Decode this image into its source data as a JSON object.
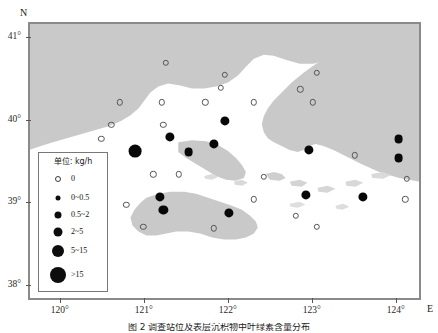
{
  "figure": {
    "caption": "图 2  调查站位及表层沉积物中叶绿素含量分布"
  },
  "axes": {
    "north_letter": "N",
    "east_letter": "E",
    "y_ticks": [
      "41°",
      "40°",
      "39°",
      "38°"
    ],
    "x_ticks": [
      "120°",
      "121°",
      "122°",
      "123°",
      "124°"
    ]
  },
  "legend": {
    "title": "单位: kg/h",
    "items": [
      {
        "label": "0",
        "style": "open",
        "size": 4
      },
      {
        "label": "0~0.5",
        "style": "filled",
        "size": 5
      },
      {
        "label": "0.5~2",
        "style": "filled",
        "size": 7
      },
      {
        "label": "2~5",
        "style": "filled",
        "size": 9
      },
      {
        "label": "5~15",
        "style": "filled",
        "size": 12
      },
      {
        "label": ">15",
        "style": "filled",
        "size": 16
      }
    ]
  },
  "chart_data": {
    "type": "scatter",
    "title": "调查站位及表层沉积物中叶绿素含量分布",
    "xlabel": "E",
    "ylabel": "N",
    "xlim": [
      119.62,
      124.3
    ],
    "ylim": [
      37.82,
      41.18
    ],
    "grid": false,
    "legend_position": "lower-left",
    "value_unit": "kg/h",
    "size_classes": [
      "0",
      "0~0.5",
      "0.5~2",
      "2~5",
      "5~15",
      ">15"
    ],
    "points": [
      {
        "lon": 121.25,
        "lat": 40.7,
        "cls": "0",
        "r": 2.2
      },
      {
        "lon": 121.95,
        "lat": 40.55,
        "cls": "0",
        "r": 2.2
      },
      {
        "lon": 123.05,
        "lat": 40.58,
        "cls": "0",
        "r": 2.2
      },
      {
        "lon": 121.9,
        "lat": 40.4,
        "cls": "0",
        "r": 2.2
      },
      {
        "lon": 122.85,
        "lat": 40.38,
        "cls": "0",
        "r": 2.2
      },
      {
        "lon": 120.7,
        "lat": 40.22,
        "cls": "0",
        "r": 2.2
      },
      {
        "lon": 121.2,
        "lat": 40.22,
        "cls": "0",
        "r": 2.2
      },
      {
        "lon": 121.72,
        "lat": 40.22,
        "cls": "0",
        "r": 2.2
      },
      {
        "lon": 122.3,
        "lat": 40.22,
        "cls": "0",
        "r": 2.2
      },
      {
        "lon": 123.0,
        "lat": 40.22,
        "cls": "0",
        "r": 2.2
      },
      {
        "lon": 120.6,
        "lat": 39.95,
        "cls": "0",
        "r": 2.2
      },
      {
        "lon": 121.22,
        "lat": 39.95,
        "cls": "0",
        "r": 2.2
      },
      {
        "lon": 121.95,
        "lat": 40.0,
        "cls": "2~5",
        "r": 4.6
      },
      {
        "lon": 120.48,
        "lat": 39.78,
        "cls": "0",
        "r": 2.2
      },
      {
        "lon": 121.3,
        "lat": 39.8,
        "cls": "2~5",
        "r": 4.6
      },
      {
        "lon": 121.82,
        "lat": 39.72,
        "cls": "2~5",
        "r": 4.6
      },
      {
        "lon": 120.88,
        "lat": 39.63,
        "cls": "5~15",
        "r": 6.4
      },
      {
        "lon": 121.52,
        "lat": 39.62,
        "cls": "2~5",
        "r": 4.4
      },
      {
        "lon": 122.95,
        "lat": 39.65,
        "cls": "2~5",
        "r": 4.6
      },
      {
        "lon": 124.02,
        "lat": 39.78,
        "cls": "2~5",
        "r": 4.4
      },
      {
        "lon": 124.02,
        "lat": 39.55,
        "cls": "2~5",
        "r": 4.4
      },
      {
        "lon": 123.5,
        "lat": 39.58,
        "cls": "0",
        "r": 2.2
      },
      {
        "lon": 121.1,
        "lat": 39.35,
        "cls": "0",
        "r": 2.2
      },
      {
        "lon": 121.4,
        "lat": 39.35,
        "cls": "0",
        "r": 2.2
      },
      {
        "lon": 122.42,
        "lat": 39.32,
        "cls": "0",
        "r": 2.2
      },
      {
        "lon": 124.12,
        "lat": 39.3,
        "cls": "0",
        "r": 2.2
      },
      {
        "lon": 121.18,
        "lat": 39.08,
        "cls": "2~5",
        "r": 4.6
      },
      {
        "lon": 122.92,
        "lat": 39.1,
        "cls": "2~5",
        "r": 4.6
      },
      {
        "lon": 123.6,
        "lat": 39.08,
        "cls": "2~5",
        "r": 4.6
      },
      {
        "lon": 122.3,
        "lat": 39.05,
        "cls": "0",
        "r": 2.2
      },
      {
        "lon": 124.1,
        "lat": 39.05,
        "cls": "0",
        "r": 2.2
      },
      {
        "lon": 120.78,
        "lat": 38.98,
        "cls": "0",
        "r": 2.2
      },
      {
        "lon": 121.22,
        "lat": 38.92,
        "cls": "2~5",
        "r": 4.6
      },
      {
        "lon": 122.0,
        "lat": 38.88,
        "cls": "2~5",
        "r": 4.6
      },
      {
        "lon": 122.8,
        "lat": 38.85,
        "cls": "0",
        "r": 2.2
      },
      {
        "lon": 120.98,
        "lat": 38.72,
        "cls": "0",
        "r": 2.2
      },
      {
        "lon": 121.82,
        "lat": 38.7,
        "cls": "0",
        "r": 2.2
      },
      {
        "lon": 123.05,
        "lat": 38.72,
        "cls": "0",
        "r": 2.2
      }
    ]
  },
  "colors": {
    "land": "#c9c9c9",
    "sea": "#ffffff",
    "dot_fill": "#080808",
    "dot_stroke": "#555555",
    "frame": "#8a8a8a"
  }
}
